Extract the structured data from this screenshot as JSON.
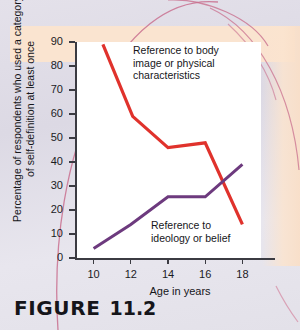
{
  "figure": {
    "caption_word": "FIGURE",
    "caption_number": "11.2"
  },
  "colors": {
    "series_body_image": "#e0322c",
    "series_ideology": "#6d3a7e",
    "axis": "#3b3b42",
    "plot_background": "#ffffff",
    "page_background": "#e1dee8",
    "band": "#fbe4cf",
    "scan_arc": "#c9708f"
  },
  "chart_data": {
    "type": "line",
    "title": "",
    "xlabel": "Age in years",
    "ylabel": "Percentage of respondents who used a category of self-definition at least once",
    "x": [
      10,
      12,
      14,
      16,
      18
    ],
    "xlim": [
      9,
      19
    ],
    "ylim": [
      0,
      90
    ],
    "xticks": [
      "10",
      "12",
      "14",
      "16",
      "18"
    ],
    "yticks": [
      "0",
      "10",
      "20",
      "30",
      "40",
      "50",
      "60",
      "70",
      "80",
      "90"
    ],
    "grid": false,
    "legend": "inline annotations",
    "series": [
      {
        "name": "Reference to body image or physical characteristics",
        "color": "#e0322c",
        "x": [
          10.5,
          12.1,
          14,
          16,
          18
        ],
        "values": [
          89,
          59,
          46,
          48,
          14
        ],
        "label_lines": [
          "Reference to body",
          "image or physical",
          "characteristics"
        ]
      },
      {
        "name": "Reference to ideology or belief",
        "color": "#6d3a7e",
        "x": [
          10,
          12,
          14,
          16,
          18
        ],
        "values": [
          4,
          14,
          25.5,
          25.5,
          39
        ],
        "label_lines": [
          "Reference to",
          "ideology or belief"
        ]
      }
    ]
  }
}
